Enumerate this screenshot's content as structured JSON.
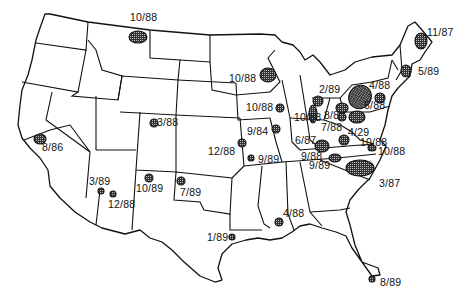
{
  "map": {
    "region": "Contiguous United States",
    "style": "black-and-white line map with hatched site markers",
    "colors": {
      "outline": "#111111",
      "background": "#ffffff",
      "marker_fill": "#555555"
    },
    "sites": [
      {
        "id": "montana",
        "label": "10/88",
        "label_x": 130,
        "label_y": 16,
        "cx": 138,
        "cy": 37,
        "rx": 9,
        "ry": 6
      },
      {
        "id": "maine",
        "label": "11/87",
        "label_x": 427,
        "label_y": 30,
        "cx": 421,
        "cy": 41,
        "rx": 6,
        "ry": 8
      },
      {
        "id": "new-hampshire",
        "label": "5/89",
        "label_x": 419,
        "label_y": 68,
        "cx": 406,
        "cy": 71,
        "rx": 5,
        "ry": 6
      },
      {
        "id": "wisconsin",
        "label": "10/88",
        "label_x": 229,
        "label_y": 76,
        "cx": 268,
        "cy": 75,
        "rx": 8,
        "ry": 7
      },
      {
        "id": "michigan",
        "label": "2/89",
        "label_x": 319,
        "label_y": 86,
        "cx": 318,
        "cy": 101,
        "rx": 5,
        "ry": 5
      },
      {
        "id": "new-york",
        "label": "4/88",
        "label_x": 369,
        "label_y": 83,
        "cx": 360,
        "cy": 97,
        "rx": 11,
        "ry": 12
      },
      {
        "id": "massachusetts",
        "label": "5/88",
        "label_x": 364,
        "label_y": 103,
        "cx": 380,
        "cy": 98,
        "rx": 5,
        "ry": 5
      },
      {
        "id": "iowa",
        "label": "10/88",
        "label_x": 246,
        "label_y": 103,
        "cx": 280,
        "cy": 108,
        "rx": 4,
        "ry": 4
      },
      {
        "id": "indiana",
        "label": "10/88",
        "label_x": 295,
        "label_y": 114,
        "cx": 313,
        "cy": 114,
        "rx": 4,
        "ry": 9
      },
      {
        "id": "ohio-ne",
        "label": "8/8",
        "label_x": 325,
        "label_y": 111,
        "cx": 342,
        "cy": 108,
        "rx": 6,
        "ry": 5
      },
      {
        "id": "pennsylvania",
        "label": "",
        "cx": 357,
        "cy": 117,
        "rx": 8,
        "ry": 6
      },
      {
        "id": "ohio",
        "label": "7/88",
        "label_x": 321,
        "label_y": 125,
        "cx": 342,
        "cy": 117,
        "rx": 4,
        "ry": 4
      },
      {
        "id": "illinois",
        "label": "9/84",
        "label_x": 247,
        "label_y": 127,
        "cx": 276,
        "cy": 129,
        "rx": 4,
        "ry": 4
      },
      {
        "id": "west-virginia",
        "label": "4/29",
        "label_x": 349,
        "label_y": 130,
        "cx": 344,
        "cy": 140,
        "rx": 5,
        "ry": 5
      },
      {
        "id": "kentucky",
        "label": "6/87",
        "label_x": 296,
        "label_y": 137,
        "cx": 322,
        "cy": 146,
        "rx": 7,
        "ry": 6
      },
      {
        "id": "virginia",
        "label": "10/88",
        "label_x": 363,
        "label_y": 140,
        "cx": 372,
        "cy": 148,
        "rx": 4,
        "ry": 3
      },
      {
        "id": "virginia-coast",
        "label": "10/88",
        "label_x": 375,
        "label_y": 147,
        "cx": 377,
        "cy": 148,
        "rx": 0,
        "ry": 0
      },
      {
        "id": "colorado",
        "label": "3/88",
        "label_x": 157,
        "label_y": 119,
        "cx": 154,
        "cy": 123,
        "rx": 4,
        "ry": 4
      },
      {
        "id": "california",
        "label": "8/86",
        "label_x": 43,
        "label_y": 145,
        "cx": 40,
        "cy": 139,
        "rx": 6,
        "ry": 5
      },
      {
        "id": "kansas",
        "label": "12/88",
        "label_x": 209,
        "label_y": 149,
        "cx": 242,
        "cy": 143,
        "rx": 4,
        "ry": 4
      },
      {
        "id": "missouri",
        "label": "9/89",
        "label_x": 258,
        "label_y": 159,
        "cx": 251,
        "cy": 158,
        "rx": 3,
        "ry": 3
      },
      {
        "id": "tennessee-e",
        "label": "9/88",
        "label_x": 301,
        "label_y": 154,
        "cx": 339,
        "cy": 159,
        "rx": 0,
        "ry": 0
      },
      {
        "id": "tennessee",
        "label": "9/89",
        "label_x": 309,
        "label_y": 163,
        "cx": 335,
        "cy": 158,
        "rx": 6,
        "ry": 4
      },
      {
        "id": "south-carolina",
        "label": "3/87",
        "label_x": 379,
        "label_y": 181,
        "cx": 360,
        "cy": 168,
        "rx": 14,
        "ry": 8
      },
      {
        "id": "arizona-1",
        "label": "3/89",
        "label_x": 89,
        "label_y": 176,
        "cx": 101,
        "cy": 191,
        "rx": 3,
        "ry": 3
      },
      {
        "id": "arizona-2",
        "label": "12/88",
        "label_x": 108,
        "label_y": 200,
        "cx": 113,
        "cy": 194,
        "rx": 3,
        "ry": 3
      },
      {
        "id": "new-mexico",
        "label": "10/89",
        "label_x": 136,
        "label_y": 184,
        "cx": 149,
        "cy": 178,
        "rx": 4,
        "ry": 4
      },
      {
        "id": "oklahoma",
        "label": "7/89",
        "label_x": 181,
        "label_y": 188,
        "cx": 181,
        "cy": 181,
        "rx": 4,
        "ry": 4
      },
      {
        "id": "louisiana",
        "label": "4/88",
        "label_x": 283,
        "label_y": 209,
        "cx": 279,
        "cy": 222,
        "rx": 4,
        "ry": 4
      },
      {
        "id": "texas",
        "label": "1/89",
        "label_x": 208,
        "label_y": 233,
        "cx": 232,
        "cy": 237,
        "rx": 3,
        "ry": 3
      },
      {
        "id": "florida",
        "label": "8/89",
        "label_x": 380,
        "label_y": 281,
        "cx": 372,
        "cy": 279,
        "rx": 3,
        "ry": 3
      }
    ]
  }
}
